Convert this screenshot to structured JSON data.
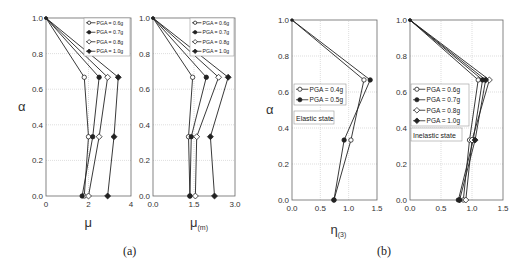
{
  "captions": {
    "a": "(a)",
    "b": "(b)"
  },
  "chart_data": [
    {
      "id": "a1",
      "type": "line",
      "panel": "(a)",
      "xlabel": "μ",
      "ylabel": "α",
      "xlim": [
        0,
        4
      ],
      "ylim": [
        0,
        1.0
      ],
      "xticks": [
        0,
        2,
        4
      ],
      "xtick_labels": [
        "0",
        "2",
        "4"
      ],
      "yticks": [
        0.0,
        0.2,
        0.4,
        0.6,
        0.8,
        1.0
      ],
      "ytick_labels": [
        "0.0",
        "0.2",
        "0.4",
        "0.6",
        "0.8",
        "1.0"
      ],
      "grid": true,
      "legend_position": "upper right",
      "annotation": "",
      "series": [
        {
          "name": "PGA = 0.6g",
          "marker": "open-circle",
          "x": [
            0,
            1.8,
            2.0,
            1.8
          ],
          "y": [
            1.0,
            0.667,
            0.333,
            0.0
          ]
        },
        {
          "name": "PGA = 0.7g",
          "marker": "filled-circle",
          "x": [
            0,
            2.5,
            2.2,
            1.7
          ],
          "y": [
            1.0,
            0.667,
            0.333,
            0.0
          ]
        },
        {
          "name": "PGA = 0.8g",
          "marker": "open-diamond",
          "x": [
            0,
            2.9,
            2.5,
            2.0
          ],
          "y": [
            1.0,
            0.667,
            0.333,
            0.0
          ]
        },
        {
          "name": "PGA = 1.0g",
          "marker": "filled-diamond",
          "x": [
            0,
            3.4,
            3.2,
            2.9
          ],
          "y": [
            1.0,
            0.667,
            0.333,
            0.0
          ]
        }
      ]
    },
    {
      "id": "a2",
      "type": "line",
      "panel": "(a)",
      "xlabel": "μ(m)",
      "ylabel": "",
      "xlim": [
        0,
        3.0
      ],
      "ylim": [
        0,
        1.0
      ],
      "xticks": [
        0,
        1.5,
        3.0
      ],
      "xtick_labels": [
        "0.0",
        "1.5",
        "3.0"
      ],
      "yticks": [
        0.0,
        0.2,
        0.4,
        0.6,
        0.8,
        1.0
      ],
      "ytick_labels": [
        "0.0",
        "0.2",
        "0.4",
        "0.6",
        "0.8",
        "1.0"
      ],
      "grid": true,
      "legend_position": "upper right",
      "annotation": "",
      "series": [
        {
          "name": "PGA = 0.6g",
          "marker": "open-circle",
          "x": [
            0,
            1.45,
            1.3,
            1.35
          ],
          "y": [
            1.0,
            0.667,
            0.333,
            0.0
          ]
        },
        {
          "name": "PGA = 0.7g",
          "marker": "filled-circle",
          "x": [
            0,
            1.95,
            1.4,
            1.35
          ],
          "y": [
            1.0,
            0.667,
            0.333,
            0.0
          ]
        },
        {
          "name": "PGA = 0.8g",
          "marker": "open-diamond",
          "x": [
            0,
            2.4,
            1.6,
            1.55
          ],
          "y": [
            1.0,
            0.667,
            0.333,
            0.0
          ]
        },
        {
          "name": "PGA = 1.0g",
          "marker": "filled-diamond",
          "x": [
            0,
            2.75,
            2.1,
            2.25
          ],
          "y": [
            1.0,
            0.667,
            0.333,
            0.0
          ]
        }
      ]
    },
    {
      "id": "b1",
      "type": "line",
      "panel": "(b)",
      "xlabel": "η(3)",
      "ylabel": "α",
      "xlim": [
        0,
        1.5
      ],
      "ylim": [
        0,
        1.0
      ],
      "xticks": [
        0,
        0.5,
        1.0,
        1.5
      ],
      "xtick_labels": [
        "0.0",
        "0.5",
        "1.0",
        "1.5"
      ],
      "yticks": [
        0.0,
        0.2,
        0.4,
        0.6,
        0.8,
        1.0
      ],
      "ytick_labels": [
        "0.0",
        "0.2",
        "0.4",
        "0.6",
        "0.8",
        "1.0"
      ],
      "grid": true,
      "legend_position": "center left",
      "annotation": "Elastic state",
      "series": [
        {
          "name": "PGA = 0.4g",
          "marker": "open-circle",
          "x": [
            0,
            1.27,
            1.04,
            0.74
          ],
          "y": [
            1.0,
            0.667,
            0.333,
            0.0
          ]
        },
        {
          "name": "PGA = 0.5g",
          "marker": "filled-circle",
          "x": [
            0,
            1.38,
            0.92,
            0.74
          ],
          "y": [
            1.0,
            0.667,
            0.333,
            0.0
          ]
        }
      ]
    },
    {
      "id": "b2",
      "type": "line",
      "panel": "(b)",
      "xlabel": "",
      "ylabel": "",
      "xlim": [
        0,
        1.5
      ],
      "ylim": [
        0,
        1.0
      ],
      "xticks": [
        0,
        0.5,
        1.0,
        1.5
      ],
      "xtick_labels": [
        "0.0",
        "0.5",
        "1.0",
        "1.5"
      ],
      "yticks": [
        0.0,
        0.2,
        0.4,
        0.6,
        0.8,
        1.0
      ],
      "ytick_labels": [
        "0.0",
        "0.2",
        "0.4",
        "0.6",
        "0.8",
        "1.0"
      ],
      "grid": true,
      "legend_position": "center left",
      "annotation": "Inelastic state",
      "series": [
        {
          "name": "PGA = 0.6g",
          "marker": "open-circle",
          "x": [
            0,
            1.1,
            0.96,
            0.86
          ],
          "y": [
            1.0,
            0.667,
            0.333,
            0.0
          ]
        },
        {
          "name": "PGA = 0.7g",
          "marker": "filled-circle",
          "x": [
            0,
            1.17,
            1.02,
            0.78
          ],
          "y": [
            1.0,
            0.667,
            0.333,
            0.0
          ]
        },
        {
          "name": "PGA = 0.8g",
          "marker": "open-diamond",
          "x": [
            0,
            1.28,
            1.0,
            0.9
          ],
          "y": [
            1.0,
            0.667,
            0.333,
            0.0
          ]
        },
        {
          "name": "PGA = 1.0g",
          "marker": "filled-diamond",
          "x": [
            0,
            1.22,
            1.05,
            0.8
          ],
          "y": [
            1.0,
            0.667,
            0.333,
            0.0
          ]
        }
      ]
    }
  ],
  "layout": {
    "plots": [
      {
        "x0": 46,
        "x1": 131,
        "y0": 196,
        "y1": 18,
        "legend": {
          "x": 84,
          "y": 18,
          "w": 46,
          "h": 38,
          "fs": 5.2
        },
        "ylab_x": 18,
        "xlab_y": 219,
        "tick_fs": 8
      },
      {
        "x0": 153,
        "x1": 235,
        "y0": 196,
        "y1": 18,
        "legend": {
          "x": 190,
          "y": 18,
          "w": 44,
          "h": 38,
          "fs": 5.2
        },
        "ylab_x": 0,
        "xlab_y": 219,
        "tick_fs": 8
      },
      {
        "x0": 292,
        "x1": 377,
        "y0": 200,
        "y1": 20,
        "legend": {
          "x": 294,
          "y": 84,
          "w": 52,
          "h": 21,
          "fs": 6.5
        },
        "annot": {
          "x": 294,
          "y": 111,
          "w": 40,
          "h": 13
        },
        "ylab_x": 266,
        "xlab_y": 226,
        "tick_fs": 8
      },
      {
        "x0": 410,
        "x1": 503,
        "y0": 200,
        "y1": 20,
        "legend": {
          "x": 411,
          "y": 84,
          "w": 58,
          "h": 42,
          "fs": 6.5
        },
        "annot": {
          "x": 411,
          "y": 128,
          "w": 51,
          "h": 13
        },
        "ylab_x": 0,
        "xlab_y": 0,
        "tick_fs": 8
      }
    ]
  }
}
